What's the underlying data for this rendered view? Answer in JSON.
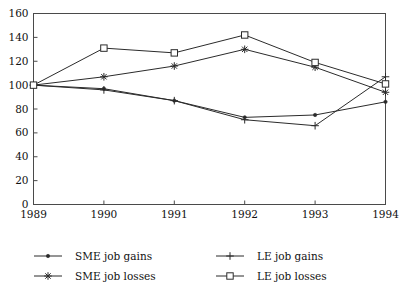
{
  "chart_data": {
    "type": "line",
    "title": "",
    "subtitle": "",
    "xlabel": "",
    "ylabel": "",
    "x": [
      1989,
      1990,
      1991,
      1992,
      1993,
      1994
    ],
    "categories": [
      "1989",
      "1990",
      "1991",
      "1992",
      "1993",
      "1994"
    ],
    "xlim": [
      1989,
      1994
    ],
    "ylim": [
      0,
      160
    ],
    "ytick_labels": [
      "0",
      "20",
      "40",
      "60",
      "80",
      "100",
      "120",
      "140",
      "160"
    ],
    "ytick_values": [
      0,
      20,
      40,
      60,
      80,
      100,
      120,
      140,
      160
    ],
    "xtick_labels": [
      "1989",
      "1990",
      "1991",
      "1992",
      "1993",
      "1994"
    ],
    "grid": false,
    "legend_position": "below",
    "series": [
      {
        "name": "SME job gains",
        "marker": "dot",
        "values": [
          100,
          97,
          87,
          73,
          75,
          86
        ]
      },
      {
        "name": "LE job gains",
        "marker": "plus",
        "values": [
          100,
          96,
          87,
          71,
          66,
          107
        ]
      },
      {
        "name": "SME job losses",
        "marker": "star",
        "values": [
          100,
          107,
          116,
          130,
          115,
          94
        ]
      },
      {
        "name": "LE job losses",
        "marker": "square",
        "values": [
          100,
          131,
          127,
          142,
          119,
          101
        ]
      }
    ]
  },
  "legend": {
    "entries": [
      {
        "label": "SME job gains",
        "marker": "dot"
      },
      {
        "label": "LE job gains",
        "marker": "plus"
      },
      {
        "label": "SME job losses",
        "marker": "star"
      },
      {
        "label": "LE job losses",
        "marker": "square"
      }
    ]
  },
  "colors": {
    "line": "#2b2b2b",
    "axis": "#4a4a4a",
    "text": "#111111",
    "background": "#ffffff"
  }
}
